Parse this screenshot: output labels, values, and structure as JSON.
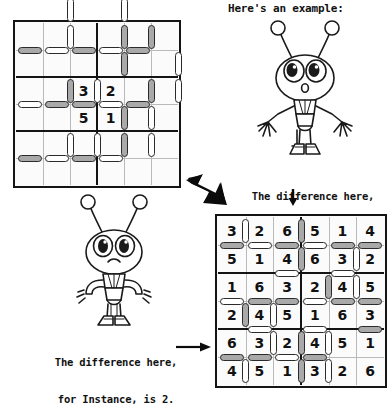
{
  "page": {
    "background": "#ffffff",
    "ink": "#111111",
    "pill_gray": "#a9a9a9",
    "pill_white": "#ffffff",
    "grid_thin_line": "#b9b9b9",
    "grid_thick_line": "#141414"
  },
  "captions": {
    "example_heading": "Here's an example:",
    "difference_right_line1": "The difference here,",
    "difference_right_line2": "for Instance, is 1.",
    "difference_left_line1": "The difference here,",
    "difference_left_line2": "for Instance, is 2."
  },
  "icons": {
    "big_arrow": "thick-arrow-down-right-icon",
    "down_arrow": "arrow-down-icon",
    "right_arrow": "arrow-right-icon",
    "alien_example": "alien-character-arms-out-icon",
    "alien_puzzle": "alien-character-hands-on-hips-icon"
  },
  "puzzle_grid": {
    "name": "unsolved-puzzle-grid",
    "rows": 6,
    "cols": 6,
    "block_rows": 2,
    "block_cols": 3,
    "given_cells": [
      {
        "row": 2,
        "col": 2,
        "value": "3"
      },
      {
        "row": 2,
        "col": 3,
        "value": "2"
      },
      {
        "row": 3,
        "col": 2,
        "value": "5"
      },
      {
        "row": 3,
        "col": 3,
        "value": "1"
      }
    ],
    "h_pills": [
      {
        "row": 0,
        "col": 0,
        "fill": "gray"
      },
      {
        "row": 0,
        "col": 1,
        "fill": "white"
      },
      {
        "row": 0,
        "col": 2,
        "fill": "gray"
      },
      {
        "row": 0,
        "col": 3,
        "fill": "white"
      },
      {
        "row": 0,
        "col": 4,
        "fill": "gray"
      },
      {
        "row": 2,
        "col": 0,
        "fill": "white"
      },
      {
        "row": 2,
        "col": 1,
        "fill": "gray"
      },
      {
        "row": 2,
        "col": 2,
        "fill": "gray"
      },
      {
        "row": 2,
        "col": 3,
        "fill": "white"
      },
      {
        "row": 2,
        "col": 4,
        "fill": "gray"
      },
      {
        "row": 4,
        "col": 0,
        "fill": "gray"
      },
      {
        "row": 4,
        "col": 1,
        "fill": "white"
      },
      {
        "row": 4,
        "col": 2,
        "fill": "gray"
      },
      {
        "row": 4,
        "col": 3,
        "fill": "white"
      }
    ],
    "v_pills": [
      {
        "row": 0,
        "col": 1,
        "fill": "white"
      },
      {
        "row": 0,
        "col": 3,
        "fill": "gray"
      },
      {
        "row": 0,
        "col": 4,
        "fill": "gray"
      },
      {
        "row": 1,
        "col": 3,
        "fill": "gray"
      },
      {
        "row": 1,
        "col": 5,
        "fill": "white"
      },
      {
        "row": 2,
        "col": 1,
        "fill": "gray"
      },
      {
        "row": 2,
        "col": 2,
        "fill": "white"
      },
      {
        "row": 2,
        "col": 4,
        "fill": "gray"
      },
      {
        "row": 2,
        "col": 5,
        "fill": "white"
      },
      {
        "row": 3,
        "col": 3,
        "fill": "gray"
      },
      {
        "row": 3,
        "col": 4,
        "fill": "white"
      },
      {
        "row": 4,
        "col": 1,
        "fill": "white"
      },
      {
        "row": 4,
        "col": 2,
        "fill": "white"
      },
      {
        "row": 4,
        "col": 3,
        "fill": "gray"
      },
      {
        "row": 4,
        "col": 4,
        "fill": "white"
      }
    ],
    "edge_pills": [
      {
        "type": "v",
        "row": -1,
        "col": 1,
        "fill": "white"
      },
      {
        "type": "v",
        "row": -1,
        "col": 3,
        "fill": "white"
      }
    ]
  },
  "solution_grid": {
    "name": "solved-example-grid",
    "rows": 6,
    "cols": 6,
    "block_rows": 2,
    "block_cols": 3,
    "values": [
      [
        "3",
        "2",
        "6",
        "5",
        "1",
        "4"
      ],
      [
        "5",
        "1",
        "4",
        "6",
        "3",
        "2"
      ],
      [
        "1",
        "6",
        "3",
        "2",
        "4",
        "5"
      ],
      [
        "2",
        "4",
        "5",
        "1",
        "6",
        "3"
      ],
      [
        "6",
        "3",
        "2",
        "4",
        "5",
        "1"
      ],
      [
        "4",
        "5",
        "1",
        "3",
        "2",
        "6"
      ]
    ],
    "h_pills": [
      {
        "row": 0,
        "col": 0,
        "fill": "gray"
      },
      {
        "row": 0,
        "col": 1,
        "fill": "white"
      },
      {
        "row": 0,
        "col": 2,
        "fill": "gray"
      },
      {
        "row": 0,
        "col": 3,
        "fill": "white"
      },
      {
        "row": 0,
        "col": 4,
        "fill": "gray"
      },
      {
        "row": 0,
        "col": 5,
        "fill": "gray"
      },
      {
        "row": 1,
        "col": 2,
        "fill": "white"
      },
      {
        "row": 1,
        "col": 4,
        "fill": "white"
      },
      {
        "row": 2,
        "col": 0,
        "fill": "white"
      },
      {
        "row": 2,
        "col": 1,
        "fill": "gray"
      },
      {
        "row": 2,
        "col": 2,
        "fill": "gray"
      },
      {
        "row": 2,
        "col": 3,
        "fill": "white"
      },
      {
        "row": 2,
        "col": 4,
        "fill": "gray"
      },
      {
        "row": 2,
        "col": 5,
        "fill": "gray"
      },
      {
        "row": 3,
        "col": 1,
        "fill": "white"
      },
      {
        "row": 3,
        "col": 3,
        "fill": "white"
      },
      {
        "row": 3,
        "col": 5,
        "fill": "gray"
      },
      {
        "row": 4,
        "col": 0,
        "fill": "gray"
      },
      {
        "row": 4,
        "col": 1,
        "fill": "gray"
      },
      {
        "row": 4,
        "col": 2,
        "fill": "white"
      },
      {
        "row": 4,
        "col": 3,
        "fill": "gray"
      }
    ],
    "v_pills": [
      {
        "row": 0,
        "col": 0,
        "fill": "white"
      },
      {
        "row": 0,
        "col": 2,
        "fill": "gray"
      },
      {
        "row": 1,
        "col": 2,
        "fill": "gray"
      },
      {
        "row": 1,
        "col": 4,
        "fill": "white"
      },
      {
        "row": 2,
        "col": 3,
        "fill": "gray"
      },
      {
        "row": 2,
        "col": 4,
        "fill": "white"
      },
      {
        "row": 3,
        "col": 0,
        "fill": "gray"
      },
      {
        "row": 3,
        "col": 1,
        "fill": "white"
      },
      {
        "row": 4,
        "col": 1,
        "fill": "white"
      },
      {
        "row": 4,
        "col": 2,
        "fill": "gray"
      },
      {
        "row": 4,
        "col": 3,
        "fill": "white"
      },
      {
        "row": 5,
        "col": 0,
        "fill": "white"
      },
      {
        "row": 5,
        "col": 2,
        "fill": "gray"
      },
      {
        "row": 5,
        "col": 3,
        "fill": "white"
      }
    ]
  }
}
